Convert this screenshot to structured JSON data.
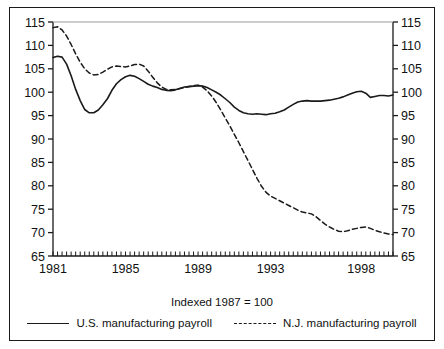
{
  "caption": "Indexed 1987 = 100",
  "legend": {
    "items": [
      {
        "label": "U.S. manufacturing payroll",
        "style": "solid",
        "color": "#1a1a1a"
      },
      {
        "label": "N.J. manufacturing payroll",
        "style": "dashed",
        "color": "#1a1a1a"
      }
    ]
  },
  "chart_data": {
    "type": "line",
    "title": "",
    "subtitle": "Indexed 1987 = 100",
    "xlabel": "",
    "ylabel": "",
    "xlim": [
      1981.0,
      1999.75
    ],
    "ylim": [
      65,
      115
    ],
    "grid": false,
    "legend_position": "bottom",
    "y_ticks": [
      65,
      70,
      75,
      80,
      85,
      90,
      95,
      100,
      105,
      110,
      115
    ],
    "y_tick_labels": [
      "65",
      "70",
      "75",
      "80",
      "85",
      "90",
      "95",
      "100",
      "105",
      "110",
      "115"
    ],
    "y_axis_both_sides": true,
    "x_ticks_labeled": [
      1981,
      1985,
      1989,
      1993,
      1998
    ],
    "x_tick_labels": [
      "1981",
      "1985",
      "1989",
      "1993",
      "1998"
    ],
    "x_minor_tick_interval_years": 0.25,
    "series": [
      {
        "name": "U.S. manufacturing payroll",
        "style": "solid",
        "color": "#1a1a1a",
        "x": [
          1981.0,
          1981.25,
          1981.5,
          1981.75,
          1982.0,
          1982.25,
          1982.5,
          1982.75,
          1983.0,
          1983.25,
          1983.5,
          1983.75,
          1984.0,
          1984.25,
          1984.5,
          1984.75,
          1985.0,
          1985.25,
          1985.5,
          1985.75,
          1986.0,
          1986.25,
          1986.5,
          1986.75,
          1987.0,
          1987.25,
          1987.5,
          1987.75,
          1988.0,
          1988.25,
          1988.5,
          1988.75,
          1989.0,
          1989.25,
          1989.5,
          1989.75,
          1990.0,
          1990.25,
          1990.5,
          1990.75,
          1991.0,
          1991.25,
          1991.5,
          1991.75,
          1992.0,
          1992.25,
          1992.5,
          1992.75,
          1993.0,
          1993.25,
          1993.5,
          1993.75,
          1994.0,
          1994.25,
          1994.5,
          1994.75,
          1995.0,
          1995.25,
          1995.5,
          1995.75,
          1996.0,
          1996.25,
          1996.5,
          1996.75,
          1997.0,
          1997.25,
          1997.5,
          1997.75,
          1998.0,
          1998.25,
          1998.5,
          1998.75,
          1999.0,
          1999.25,
          1999.5,
          1999.75
        ],
        "values": [
          107.4,
          107.7,
          107.5,
          106.0,
          103.5,
          100.6,
          98.2,
          96.3,
          95.6,
          95.6,
          96.2,
          97.3,
          98.6,
          100.4,
          101.8,
          102.7,
          103.3,
          103.6,
          103.4,
          102.9,
          102.3,
          101.7,
          101.3,
          101.0,
          100.6,
          100.4,
          100.3,
          100.5,
          100.8,
          101.1,
          101.2,
          101.3,
          101.4,
          101.3,
          101.0,
          100.5,
          100.0,
          99.4,
          98.6,
          97.8,
          96.8,
          96.1,
          95.6,
          95.4,
          95.3,
          95.4,
          95.3,
          95.2,
          95.4,
          95.5,
          95.8,
          96.2,
          96.8,
          97.4,
          97.9,
          98.1,
          98.2,
          98.1,
          98.1,
          98.1,
          98.2,
          98.3,
          98.5,
          98.7,
          99.0,
          99.4,
          99.8,
          100.1,
          100.2,
          99.8,
          98.9,
          99.1,
          99.3,
          99.3,
          99.2,
          99.4
        ]
      },
      {
        "name": "N.J. manufacturing payroll",
        "style": "dashed",
        "color": "#1a1a1a",
        "x": [
          1981.0,
          1981.25,
          1981.5,
          1981.75,
          1982.0,
          1982.25,
          1982.5,
          1982.75,
          1983.0,
          1983.25,
          1983.5,
          1983.75,
          1984.0,
          1984.25,
          1984.5,
          1984.75,
          1985.0,
          1985.25,
          1985.5,
          1985.75,
          1986.0,
          1986.25,
          1986.5,
          1986.75,
          1987.0,
          1987.25,
          1987.5,
          1987.75,
          1988.0,
          1988.25,
          1988.5,
          1988.75,
          1989.0,
          1989.25,
          1989.5,
          1989.75,
          1990.0,
          1990.25,
          1990.5,
          1990.75,
          1991.0,
          1991.25,
          1991.5,
          1991.75,
          1992.0,
          1992.25,
          1992.5,
          1992.75,
          1993.0,
          1993.25,
          1993.5,
          1993.75,
          1994.0,
          1994.25,
          1994.5,
          1994.75,
          1995.0,
          1995.25,
          1995.5,
          1995.75,
          1996.0,
          1996.25,
          1996.5,
          1996.75,
          1997.0,
          1997.25,
          1997.5,
          1997.75,
          1998.0,
          1998.25,
          1998.5,
          1998.75,
          1999.0,
          1999.25,
          1999.5,
          1999.75
        ],
        "values": [
          113.8,
          114.0,
          113.3,
          112.0,
          110.2,
          108.2,
          106.4,
          105.0,
          104.1,
          103.7,
          103.8,
          104.3,
          104.9,
          105.4,
          105.6,
          105.5,
          105.4,
          105.6,
          105.9,
          106.0,
          105.6,
          104.5,
          103.2,
          102.0,
          101.1,
          100.6,
          100.5,
          100.6,
          100.8,
          101.0,
          101.2,
          101.4,
          101.5,
          101.1,
          100.3,
          99.2,
          97.8,
          96.2,
          94.5,
          92.8,
          91.0,
          89.2,
          87.3,
          85.4,
          83.5,
          81.6,
          79.9,
          78.6,
          77.8,
          77.3,
          76.8,
          76.3,
          75.8,
          75.3,
          74.8,
          74.4,
          74.2,
          74.0,
          73.4,
          72.6,
          71.8,
          71.2,
          70.7,
          70.3,
          70.2,
          70.4,
          70.7,
          70.9,
          71.1,
          71.2,
          70.9,
          70.5,
          70.2,
          69.9,
          69.7,
          69.6
        ]
      }
    ]
  }
}
